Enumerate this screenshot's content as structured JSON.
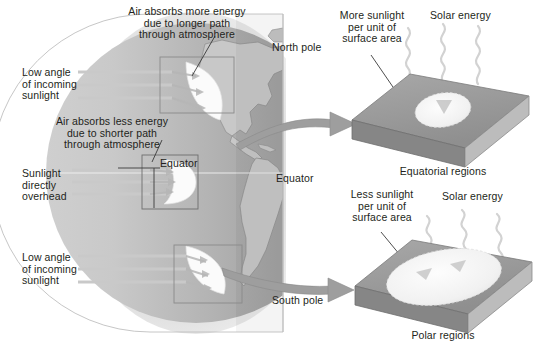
{
  "figure": {
    "topic": "Solar energy distribution by latitude",
    "background_color": "#ffffff",
    "text_color": "#231f20"
  },
  "globe": {
    "name": "earth-globe",
    "atmosphere_color": "#e3e3e3",
    "ocean_light_color": "#d2d2d2",
    "ocean_dark_color": "#9a9a9a",
    "land_color": "#c6c6c6",
    "labels": {
      "north_pole": "North pole",
      "south_pole": "South pole",
      "equator_left": "Equator",
      "equator_right": "Equator"
    }
  },
  "left_annotations": [
    {
      "name": "high-latitude-north-note",
      "text": "Air absorbs more energy\ndue to longer path\nthrough atmosphere",
      "align": "center"
    },
    {
      "name": "low-angle-north-label",
      "text": "Low angle\nof incoming\nsunlight",
      "align": "left"
    },
    {
      "name": "equator-path-note",
      "text": "Air absorbs less energy\ndue to shorter path\nthrough atmosphere",
      "align": "center"
    },
    {
      "name": "sunlight-overhead-label",
      "text": "Sunlight\ndirectly\noverhead",
      "align": "left"
    },
    {
      "name": "low-angle-south-label",
      "text": "Low angle\nof incoming\nsunlight",
      "align": "left"
    }
  ],
  "panels": [
    {
      "name": "equatorial-regions-panel",
      "caption": "Equatorial regions",
      "solar_energy_label": "Solar energy",
      "sunlight_note": "More sunlight\nper unit of\nsurface area",
      "spot_size": "small",
      "slab_top_color": "#9c9c9c",
      "slab_front_color": "#8a8a8a",
      "slab_side_color": "#bdbdbd",
      "spot_color": "#f2f2f2"
    },
    {
      "name": "polar-regions-panel",
      "caption": "Polar regions",
      "solar_energy_label": "Solar energy",
      "sunlight_note": "Less sunlight\nper unit of\nsurface area",
      "spot_size": "large",
      "slab_top_color": "#9c9c9c",
      "slab_front_color": "#8a8a8a",
      "slab_side_color": "#bdbdbd",
      "spot_color": "#f2f2f2"
    }
  ],
  "insets": [
    {
      "name": "inset-box-north",
      "label": "longer atmospheric path at high northern latitude"
    },
    {
      "name": "inset-box-equator",
      "label": "shorter atmospheric path at the equator"
    },
    {
      "name": "inset-box-south",
      "label": "longer atmospheric path at high southern latitude"
    }
  ],
  "sun_rays": {
    "name": "incoming-sunlight-rays",
    "color": "#c8c8c8",
    "groups": 3,
    "rays_per_group": 3
  },
  "connector_arrows": [
    {
      "name": "arrow-to-equatorial-panel",
      "color": "#9a9a9a"
    },
    {
      "name": "arrow-to-polar-panel",
      "color": "#9a9a9a"
    }
  ]
}
